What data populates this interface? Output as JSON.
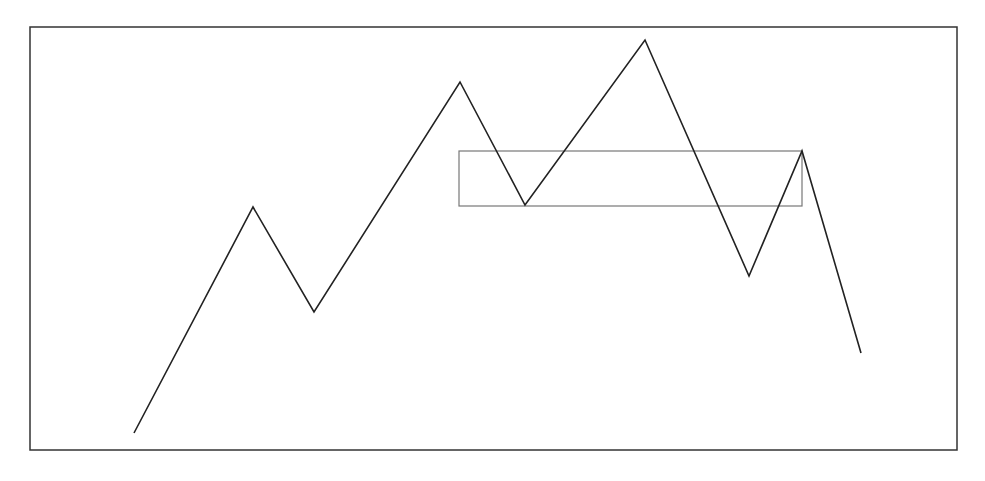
{
  "diagram": {
    "type": "zigzag-price-pattern",
    "canvas": {
      "width": 985,
      "height": 481,
      "background": "#ffffff"
    },
    "frame": {
      "x1": 30,
      "y1": 27,
      "x2": 957,
      "y2": 450,
      "stroke": "#333333",
      "stroke_width": 1.5
    },
    "zigzag": {
      "stroke": "#222222",
      "stroke_width": 1.6,
      "points": [
        [
          134,
          433
        ],
        [
          253,
          207
        ],
        [
          314,
          312
        ],
        [
          460,
          82
        ],
        [
          525,
          205
        ],
        [
          645,
          40
        ],
        [
          749,
          276
        ],
        [
          802,
          151
        ],
        [
          861,
          353
        ]
      ]
    },
    "highlight_box": {
      "x": 459,
      "y": 151,
      "width": 343,
      "height": 55,
      "stroke": "#777777",
      "stroke_width": 1.2
    }
  }
}
